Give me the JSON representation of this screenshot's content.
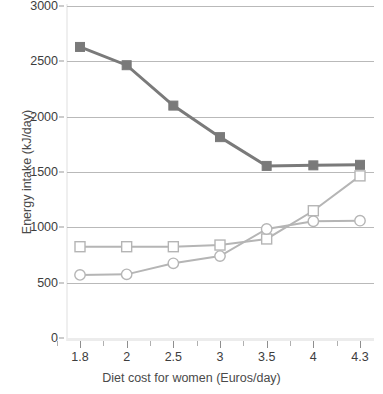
{
  "chart_data": {
    "type": "line",
    "title": "",
    "xlabel": "Diet cost for women (Euros/day)",
    "ylabel": "Energy intake (kJ/day)",
    "categories": [
      "1.8",
      "2",
      "2.5",
      "3",
      "3.5",
      "4",
      "4.3"
    ],
    "x_tick_labels": [
      "1.8",
      "2",
      "2.5",
      "3",
      "3.5",
      "4",
      "4.3"
    ],
    "y_tick_labels": [
      "3000",
      "2500",
      "2000",
      "1500",
      "1000",
      "500",
      "0"
    ],
    "y_ticks": [
      3000,
      2500,
      2000,
      1500,
      1000,
      500,
      0
    ],
    "ylim": [
      0,
      3000
    ],
    "grid": "horizontal",
    "legend_position": "none",
    "series": [
      {
        "name": "dark-filled-square-series",
        "marker": "filled-square",
        "color": "#7a7a7a",
        "values": [
          2630,
          2465,
          2100,
          1815,
          1555,
          1560,
          1565
        ]
      },
      {
        "name": "light-open-square-series",
        "marker": "open-square",
        "color": "#b5b5b5",
        "values": [
          825,
          825,
          825,
          840,
          895,
          1150,
          1465
        ]
      },
      {
        "name": "light-open-circle-series",
        "marker": "open-circle",
        "color": "#b5b5b5",
        "values": [
          570,
          575,
          675,
          740,
          985,
          1055,
          1060
        ]
      }
    ]
  },
  "axes": {
    "y_title": "Energy intake (kJ/day)",
    "x_title": "Diet cost for women (Euros/day)",
    "y_labels": [
      "3000",
      "2500",
      "2000",
      "1500",
      "1000",
      "500",
      "0"
    ],
    "x_labels": [
      "1.8",
      "2",
      "2.5",
      "3",
      "3.5",
      "4",
      "4.3"
    ]
  },
  "colors": {
    "dark_series": "#7a7a7a",
    "light_series": "#b5b5b5",
    "gridline": "#b9b9b9",
    "text": "#3d3d3d",
    "axis": "#ececec",
    "background": "#ffffff"
  }
}
